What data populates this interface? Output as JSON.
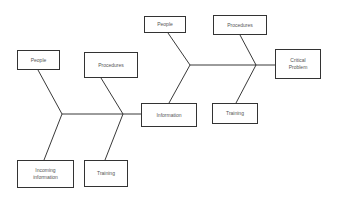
{
  "diagram": {
    "type": "fishbone",
    "line_color": "#222222",
    "nodes": {
      "people_left": {
        "label": "People"
      },
      "procedures_left": {
        "label": "Procedures"
      },
      "people_top": {
        "label": "People"
      },
      "procedures_top": {
        "label": "Procedures"
      },
      "critical_problem": {
        "label": "Critical\nProblem"
      },
      "information": {
        "label": "Information"
      },
      "training_right": {
        "label": "Training"
      },
      "incoming_information": {
        "label": "Incoming\ninformation"
      },
      "training_left": {
        "label": "Training"
      }
    },
    "edges": [
      {
        "from": "people_left",
        "to": "spine_lower_junction_1"
      },
      {
        "from": "incoming_information",
        "to": "spine_lower_junction_1"
      },
      {
        "from": "procedures_left",
        "to": "spine_lower_junction_2"
      },
      {
        "from": "training_left",
        "to": "spine_lower_junction_2"
      },
      {
        "from": "spine_lower",
        "to": "information"
      },
      {
        "from": "information",
        "to": "spine_upper_junction_1"
      },
      {
        "from": "people_top",
        "to": "spine_upper_junction_1"
      },
      {
        "from": "procedures_top",
        "to": "spine_upper_junction_2"
      },
      {
        "from": "training_right",
        "to": "spine_upper_junction_2"
      },
      {
        "from": "spine_upper",
        "to": "critical_problem"
      }
    ]
  }
}
